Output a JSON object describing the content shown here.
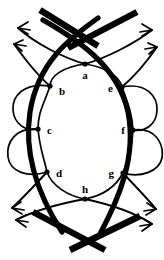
{
  "figure": {
    "width": 164,
    "height": 260,
    "background_color": "#ffffff",
    "ink_color": "#000000"
  },
  "nodes": [
    {
      "id": "a",
      "label": "a",
      "x": 85,
      "y": 64,
      "label_x": 85,
      "label_y": 76,
      "label_anchor": "middle"
    },
    {
      "id": "b",
      "label": "b",
      "x": 50,
      "y": 86,
      "label_x": 59,
      "label_y": 92,
      "label_anchor": "start"
    },
    {
      "id": "c",
      "label": "c",
      "x": 38,
      "y": 129,
      "label_x": 47,
      "label_y": 131,
      "label_anchor": "start"
    },
    {
      "id": "d",
      "label": "d",
      "x": 47,
      "y": 172,
      "label_x": 56,
      "label_y": 174,
      "label_anchor": "start"
    },
    {
      "id": "e",
      "label": "e",
      "x": 122,
      "y": 87,
      "label_x": 113,
      "label_y": 89,
      "label_anchor": "end"
    },
    {
      "id": "f",
      "label": "f",
      "x": 133,
      "y": 130,
      "label_x": 125,
      "label_y": 131,
      "label_anchor": "end"
    },
    {
      "id": "g",
      "label": "g",
      "x": 123,
      "y": 173,
      "label_x": 114,
      "label_y": 174,
      "label_anchor": "end"
    },
    {
      "id": "h",
      "label": "h",
      "x": 85,
      "y": 199,
      "label_x": 85,
      "label_y": 190,
      "label_anchor": "middle"
    }
  ],
  "strands": {
    "thick_outer_left": "M 98,18 C 70,38 38,62 30,112 C 23,158 40,198 62,232",
    "thick_outer_right": "M 43,20 C 78,40 118,66 128,112 C 137,158 118,200 100,234",
    "thick_tail_top_left": "M 40,10 L 98,46",
    "thick_tail_top_right": "M 137,12 L 68,48",
    "thick_tail_bottom_left": "M 33,212 L 105,250",
    "thick_tail_bottom_right": "M 140,216 L 70,250",
    "inner_loop_left": "M 85,64 C 63,67 50,76 50,86 C 44,104 38,112 38,129 C 40,150 44,158 47,172 C 52,186 68,196 85,199",
    "inner_loop_right": "M 85,64 C 106,67 120,77 122,87 C 128,104 132,113 133,130 C 132,150 128,159 123,173 C 115,188 101,196 85,199",
    "left_lobe_upper": "M 50,86 C 24,82 12,96 13,110 C 14,124 26,132 38,129",
    "left_lobe_lower": "M 38,129 C 16,127 6,142 8,157 C 10,172 28,178 47,172",
    "right_lobe_upper": "M 122,87 C 147,82 158,97 157,111 C 156,125 145,132 133,130",
    "right_lobe_lower": "M 133,130 C 155,127 164,143 162,158 C 159,172 140,178 123,173"
  },
  "arrow_lines": [
    {
      "id": "arrow-top-left-outer",
      "path": "M 85,64 C 64,58 36,44 18,28"
    },
    {
      "id": "arrow-top-left-inner",
      "path": "M 50,86 C 36,74 24,58 14,44"
    },
    {
      "id": "arrow-top-right-outer",
      "path": "M 85,64 C 106,58 134,44 152,30"
    },
    {
      "id": "arrow-top-right-inner",
      "path": "M 122,87 C 136,75 148,60 157,47"
    },
    {
      "id": "arrow-bottom-left-outer",
      "path": "M 85,199 C 63,203 36,210 16,220"
    },
    {
      "id": "arrow-bottom-left-inner",
      "path": "M 47,172 C 36,184 25,196 12,208"
    },
    {
      "id": "arrow-bottom-right-outer",
      "path": "M 85,199 C 108,204 134,212 152,224"
    },
    {
      "id": "arrow-bottom-right-inner",
      "path": "M 123,173 C 134,185 146,197 156,209"
    }
  ],
  "arrow_heads": [
    {
      "id": "head-top-left-outer",
      "path": "M 28,22 L 18,28 L 28,34 M 18,28 L 30,30"
    },
    {
      "id": "head-top-left-inner",
      "path": "M 23,40 L 14,44 L 22,51 M 14,44 L 26,46"
    },
    {
      "id": "head-top-right-outer",
      "path": "M 142,24 L 152,30 L 142,36 M 152,30 L 140,32"
    },
    {
      "id": "head-top-right-inner",
      "path": "M 148,43 L 157,47 L 149,54 M 157,47 L 145,49"
    },
    {
      "id": "head-bottom-left-outer",
      "path": "M 26,215 L 16,220 L 26,227 M 16,220 L 28,222"
    },
    {
      "id": "head-bottom-left-inner",
      "path": "M 21,202 L 12,208 L 22,214 M 12,208 L 24,210"
    },
    {
      "id": "head-bottom-right-outer",
      "path": "M 142,218 L 152,224 L 142,231 M 152,224 L 140,226"
    },
    {
      "id": "head-bottom-right-inner",
      "path": "M 147,203 L 156,209 L 146,215 M 156,209 L 144,211"
    }
  ],
  "geometry": {
    "vertex_radius": 2.6,
    "thick_stroke_width": 5.2,
    "thin_stroke_width": 1.7
  }
}
